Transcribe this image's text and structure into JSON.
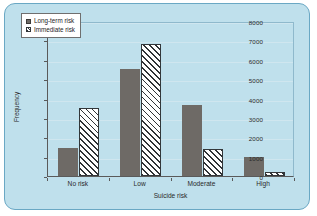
{
  "chart_data": {
    "type": "bar",
    "title": "",
    "xlabel": "Suicide risk",
    "ylabel": "Frequency",
    "categories": [
      "No risk",
      "Low",
      "Moderate",
      "High"
    ],
    "series": [
      {
        "name": "Long-term risk",
        "values": [
          1450,
          5530,
          3670,
          1000
        ]
      },
      {
        "name": "Immediate risk",
        "values": [
          3520,
          6830,
          1400,
          200
        ]
      }
    ],
    "ylim": [
      0,
      8000
    ],
    "yticks": [
      0,
      1000,
      2000,
      3000,
      4000,
      5000,
      6000,
      7000,
      8000
    ],
    "ytick_labels": [
      "0",
      "1000",
      "2000",
      "3000",
      "4000",
      "5000",
      "6000",
      "7000",
      "8000"
    ],
    "grid": true,
    "legend_position": "top-left",
    "colors": {
      "long_term_risk": "#6e6a66",
      "immediate_risk": "#ffffff",
      "hatch": "#2f3336",
      "panel_background": "#bfe0ec",
      "panel_border": "#6aa8c4",
      "axis": "#5a5a5a",
      "gridline": "#cfe6ef"
    }
  }
}
